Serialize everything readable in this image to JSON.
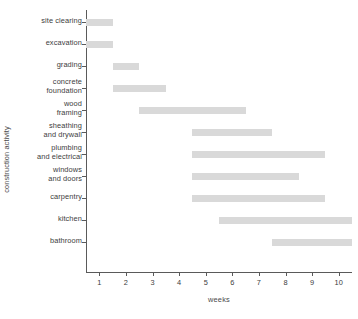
{
  "chart_data": {
    "type": "bar",
    "subtype": "gantt",
    "title": "",
    "xlabel": "weeks",
    "ylabel": "construction activity",
    "xlim": [
      0.5,
      10.5
    ],
    "xticks": [
      1,
      2,
      3,
      4,
      5,
      6,
      7,
      8,
      9,
      10
    ],
    "xticklabels": [
      "1",
      "2",
      "3",
      "4",
      "5",
      "6",
      "7",
      "8",
      "9",
      "10"
    ],
    "grid": false,
    "legend": false,
    "bar_color": "#d9d9d9",
    "axis_color": "#5a5a5a",
    "categories": [
      "site clearing",
      "excavation",
      "grading",
      "concrete foundation",
      "wood framing",
      "sheathing and drywall",
      "plumbing and electrical",
      "windows and doors",
      "carpentry",
      "kitchen",
      "bathroom"
    ],
    "tasks": [
      {
        "label_lines": [
          "site clearing"
        ],
        "start": 0.5,
        "end": 1.5,
        "duration": 1
      },
      {
        "label_lines": [
          "excavation"
        ],
        "start": 0.5,
        "end": 1.5,
        "duration": 1
      },
      {
        "label_lines": [
          "grading"
        ],
        "start": 1.5,
        "end": 2.5,
        "duration": 1
      },
      {
        "label_lines": [
          "concrete",
          "foundation"
        ],
        "start": 1.5,
        "end": 3.5,
        "duration": 2
      },
      {
        "label_lines": [
          "wood",
          "framing"
        ],
        "start": 2.5,
        "end": 6.5,
        "duration": 4
      },
      {
        "label_lines": [
          "sheathing",
          "and drywall"
        ],
        "start": 4.5,
        "end": 7.5,
        "duration": 3
      },
      {
        "label_lines": [
          "plumbing",
          "and electrical"
        ],
        "start": 4.5,
        "end": 9.5,
        "duration": 5
      },
      {
        "label_lines": [
          "windows",
          "and doors"
        ],
        "start": 4.5,
        "end": 8.5,
        "duration": 4
      },
      {
        "label_lines": [
          "carpentry"
        ],
        "start": 4.5,
        "end": 9.5,
        "duration": 5
      },
      {
        "label_lines": [
          "kitchen"
        ],
        "start": 5.5,
        "end": 10.5,
        "duration": 5
      },
      {
        "label_lines": [
          "bathroom"
        ],
        "start": 7.5,
        "end": 10.5,
        "duration": 3
      }
    ]
  }
}
